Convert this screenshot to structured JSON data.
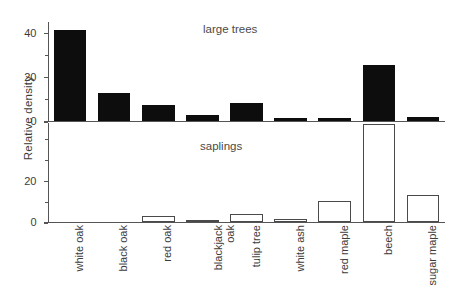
{
  "chart_data": {
    "type": "bar",
    "title": "",
    "xlabel": "",
    "ylabel": "Relative density",
    "grid": false,
    "legend": "none",
    "categories": [
      "white oak",
      "black oak",
      "red oak",
      "blackjack oak",
      "tulip tree",
      "white ash",
      "red maple",
      "beech",
      "sugar maple"
    ],
    "panels": [
      {
        "name": "large trees",
        "caption": "large trees",
        "style": "filled",
        "ylim": [
          0,
          45
        ],
        "yticks": [
          0,
          20,
          40
        ],
        "ytick_labels": [
          "0",
          "20",
          "40"
        ],
        "minor_yticks": [
          10,
          30
        ],
        "values": [
          41,
          12.5,
          7,
          2.5,
          8,
          1.5,
          1.5,
          25,
          2
        ]
      },
      {
        "name": "saplings",
        "caption": "saplings",
        "style": "hollow",
        "ylim": [
          0,
          48
        ],
        "yticks": [
          0,
          20
        ],
        "ytick_labels": [
          "0",
          "20"
        ],
        "minor_yticks": [
          10,
          30,
          40
        ],
        "values": [
          0,
          0,
          3,
          1,
          4,
          1.5,
          10,
          47,
          13
        ]
      }
    ],
    "colors": {
      "bar_filled": "#0d0d0d",
      "bar_outline": "#4a4a4a",
      "axis": "#555555",
      "text": "#3c3c3c",
      "background": "#ffffff"
    }
  },
  "axis": {
    "ylabel": "Relative density"
  }
}
